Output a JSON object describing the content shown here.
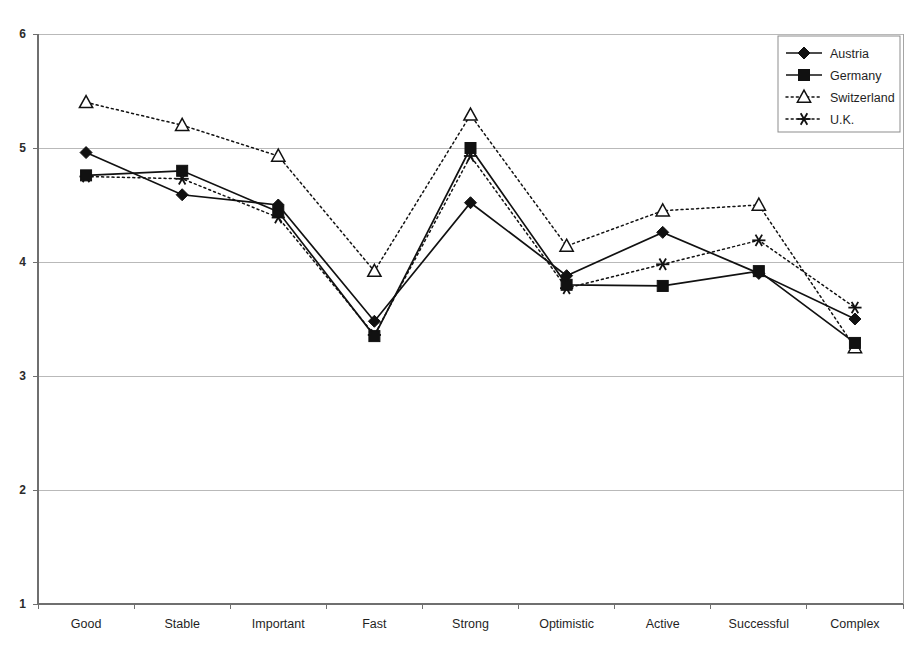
{
  "chart_data": {
    "type": "line",
    "title": "",
    "subtitle": "",
    "xlabel": "",
    "ylabel": "",
    "ylim": [
      1,
      6
    ],
    "y_ticks": [
      1,
      2,
      3,
      4,
      5,
      6
    ],
    "y_tick_labels": [
      "1",
      "2",
      "3",
      "4",
      "5",
      "6"
    ],
    "grid": true,
    "legend_position": "top-right",
    "categories": [
      "Good",
      "Stable",
      "Important",
      "Fast",
      "Strong",
      "Optimistic",
      "Active",
      "Successful",
      "Complex"
    ],
    "series": [
      {
        "name": "Austria",
        "marker": "filled-diamond",
        "line_style": "solid",
        "color": "#111111",
        "values": [
          4.96,
          4.59,
          4.5,
          3.48,
          4.52,
          3.88,
          4.26,
          3.9,
          3.5
        ]
      },
      {
        "name": "Germany",
        "marker": "filled-square",
        "line_style": "solid",
        "color": "#111111",
        "values": [
          4.76,
          4.8,
          4.44,
          3.35,
          5.0,
          3.8,
          3.79,
          3.92,
          3.29
        ]
      },
      {
        "name": "Switzerland",
        "marker": "open-triangle",
        "line_style": "dotted",
        "color": "#111111",
        "values": [
          5.4,
          5.2,
          4.93,
          3.92,
          5.29,
          4.14,
          4.45,
          4.5,
          3.25
        ]
      },
      {
        "name": "U.K.",
        "marker": "star",
        "line_style": "dotted",
        "color": "#111111",
        "values": [
          4.75,
          4.73,
          4.39,
          3.36,
          4.93,
          3.77,
          3.98,
          4.19,
          3.6
        ]
      }
    ]
  },
  "legend": {
    "entries": [
      {
        "label": "Austria",
        "marker": "filled-diamond",
        "line_style": "solid"
      },
      {
        "label": "Germany",
        "marker": "filled-square",
        "line_style": "solid"
      },
      {
        "label": "Switzerland",
        "marker": "open-triangle",
        "line_style": "dotted"
      },
      {
        "label": "U.K.",
        "marker": "star",
        "line_style": "dotted"
      }
    ]
  },
  "colors": {
    "ink": "#111111",
    "grid": "#b9b9b9",
    "axis": "#6f6f6f",
    "background": "#ffffff"
  }
}
